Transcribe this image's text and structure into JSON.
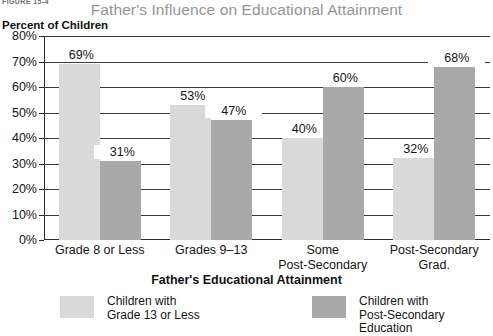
{
  "figure_number": "FIGURE 15-4",
  "chart_data": {
    "type": "bar",
    "title": "Father's Influence on Educational Attainment",
    "xlabel": "Father's Educational Attainment",
    "ylabel": "Percent of Children",
    "ylim": [
      0,
      80
    ],
    "ytick_labels": [
      "80%",
      "70%",
      "60%",
      "50%",
      "40%",
      "30%",
      "20%",
      "10%",
      "0%"
    ],
    "ytick_values": [
      80,
      70,
      60,
      50,
      40,
      30,
      20,
      10,
      0
    ],
    "grid": true,
    "legend_position": "bottom",
    "categories": [
      "Grade 8 or Less",
      "Grades 9–13",
      "Some\nPost-Secondary",
      "Post-Secondary\nGrad."
    ],
    "series": [
      {
        "name": "Children with\nGrade 13 or Less",
        "color": "#d9d9d9",
        "values": [
          69,
          53,
          40,
          32
        ],
        "labels": [
          "69%",
          "53%",
          "40%",
          "32%"
        ]
      },
      {
        "name": "Children with\nPost-Secondary Education",
        "color": "#a9a9a9",
        "values": [
          31,
          47,
          60,
          68
        ],
        "labels": [
          "31%",
          "47%",
          "60%",
          "68%"
        ]
      }
    ]
  },
  "legend": [
    {
      "label": "Children with\nGrade 13 or Less",
      "color": "#d9d9d9",
      "swatch": "light"
    },
    {
      "label": "Children with\nPost-Secondary Education",
      "color": "#a9a9a9",
      "swatch": "dark"
    }
  ]
}
